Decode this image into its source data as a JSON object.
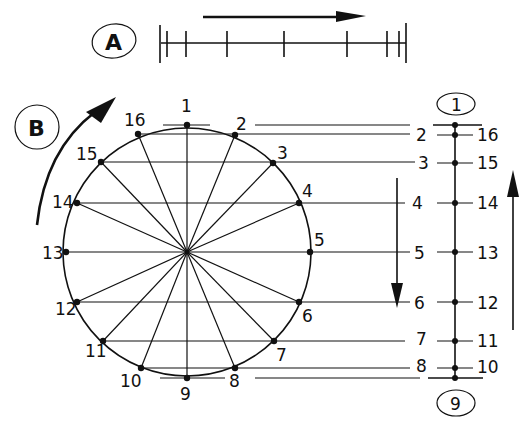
{
  "section_a": {
    "label": "A",
    "arrow_direction": "right",
    "scale_ticks_x": [
      161,
      167,
      186,
      227,
      284,
      347,
      387,
      399,
      406
    ]
  },
  "section_b": {
    "label": "B",
    "arrow_direction": "clockwise",
    "circle": {
      "cx": 187,
      "cy": 252,
      "r": 126
    },
    "points": [
      {
        "n": "1",
        "x": 187,
        "y": 125
      },
      {
        "n": "2",
        "x": 235,
        "y": 135
      },
      {
        "n": "3",
        "x": 273,
        "y": 163
      },
      {
        "n": "4",
        "x": 299,
        "y": 203
      },
      {
        "n": "5",
        "x": 310,
        "y": 252
      },
      {
        "n": "6",
        "x": 299,
        "y": 302
      },
      {
        "n": "7",
        "x": 274,
        "y": 341
      },
      {
        "n": "8",
        "x": 235,
        "y": 368
      },
      {
        "n": "9",
        "x": 187,
        "y": 378
      },
      {
        "n": "10",
        "x": 141,
        "y": 368
      },
      {
        "n": "11",
        "x": 103,
        "y": 341
      },
      {
        "n": "12",
        "x": 77,
        "y": 302
      },
      {
        "n": "13",
        "x": 66,
        "y": 252
      },
      {
        "n": "14",
        "x": 77,
        "y": 203
      },
      {
        "n": "15",
        "x": 101,
        "y": 162
      },
      {
        "n": "16",
        "x": 138,
        "y": 134
      }
    ]
  },
  "projection": {
    "axis_x": 455,
    "top_label": "1",
    "bottom_label": "9",
    "left_labels": [
      "2",
      "3",
      "4",
      "5",
      "6",
      "7",
      "8"
    ],
    "right_labels": [
      "16",
      "15",
      "14",
      "13",
      "12",
      "11",
      "10"
    ],
    "down_arrow": "down",
    "up_arrow": "up"
  }
}
